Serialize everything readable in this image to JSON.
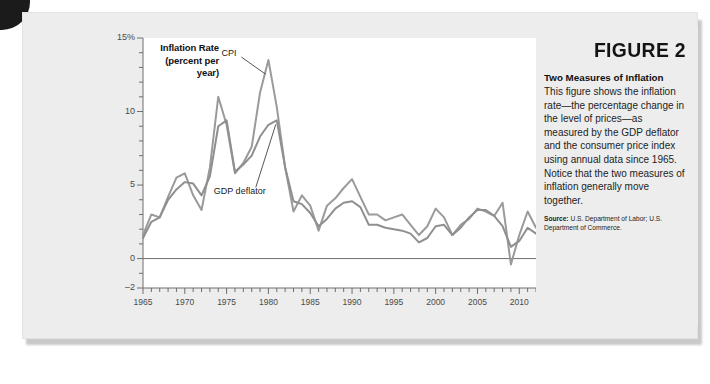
{
  "figure": {
    "number_label": "FIGURE 2",
    "caption_title": "Two Measures of Inflation",
    "caption_body": "This figure shows the inflation rate—the percentage change in the level of prices—as measured by the GDP deflator and the consumer price index using annual data since 1965. Notice that the two measures of inflation generally move together.",
    "source_label": "Source:",
    "source_text": "U.S. Department of Labor; U.S. Department of Commerce."
  },
  "colors": {
    "card_background": "#ededed",
    "plot_background": "#ffffff",
    "line_cpi": "#9a9a9a",
    "line_deflator": "#8f8f8f",
    "axis": "#6e6e6e",
    "text": "#1d1d1d"
  },
  "chart_data": {
    "type": "line",
    "title": "Inflation Rate",
    "subtitle": "(percent per year)",
    "xlabel": "",
    "ylabel": "Inflation Rate (percent per year)",
    "xlim": [
      1965,
      2012
    ],
    "ylim": [
      -2,
      15
    ],
    "yticks": [
      15,
      10,
      5,
      0,
      -2
    ],
    "ytick_labels": [
      "15%",
      "10",
      "5",
      "0",
      "–2"
    ],
    "y_minor_tick_step": 1,
    "xticks": [
      1965,
      1970,
      1975,
      1980,
      1985,
      1990,
      1995,
      2000,
      2005,
      2010
    ],
    "xtick_labels": [
      "1965",
      "1970",
      "1975",
      "1980",
      "1985",
      "1990",
      "1995",
      "2000",
      "2005",
      "2010"
    ],
    "x_minor_tick_step": 1,
    "grid": false,
    "legend_position": "inline-annotation",
    "annotations": [
      {
        "text": "CPI",
        "series": "CPI",
        "points_at_year": 1980
      },
      {
        "text": "GDP deflator",
        "series": "GDP deflator",
        "points_at_year": 1981
      }
    ],
    "x": [
      1965,
      1966,
      1967,
      1968,
      1969,
      1970,
      1971,
      1972,
      1973,
      1974,
      1975,
      1976,
      1977,
      1978,
      1979,
      1980,
      1981,
      1982,
      1983,
      1984,
      1985,
      1986,
      1987,
      1988,
      1989,
      1990,
      1991,
      1992,
      1993,
      1994,
      1995,
      1996,
      1997,
      1998,
      1999,
      2000,
      2001,
      2002,
      2003,
      2004,
      2005,
      2006,
      2007,
      2008,
      2009,
      2010,
      2011,
      2012
    ],
    "series": [
      {
        "name": "CPI",
        "values": [
          1.6,
          3.0,
          2.8,
          4.2,
          5.5,
          5.8,
          4.3,
          3.3,
          6.2,
          11.0,
          9.1,
          5.8,
          6.5,
          7.6,
          11.3,
          13.5,
          10.3,
          6.2,
          3.2,
          4.3,
          3.6,
          1.9,
          3.6,
          4.1,
          4.8,
          5.4,
          4.2,
          3.0,
          3.0,
          2.6,
          2.8,
          3.0,
          2.3,
          1.6,
          2.2,
          3.4,
          2.8,
          1.6,
          2.3,
          2.7,
          3.4,
          3.2,
          2.9,
          3.8,
          -0.4,
          1.6,
          3.2,
          2.1
        ]
      },
      {
        "name": "GDP deflator",
        "values": [
          1.4,
          2.5,
          2.8,
          4.0,
          4.7,
          5.2,
          5.1,
          4.3,
          5.6,
          9.0,
          9.4,
          5.9,
          6.4,
          7.0,
          8.3,
          9.1,
          9.4,
          6.2,
          3.9,
          3.7,
          3.1,
          2.2,
          2.7,
          3.4,
          3.8,
          3.9,
          3.5,
          2.3,
          2.3,
          2.1,
          2.0,
          1.9,
          1.7,
          1.1,
          1.4,
          2.2,
          2.3,
          1.6,
          2.1,
          2.8,
          3.3,
          3.3,
          2.9,
          2.2,
          0.8,
          1.2,
          2.1,
          1.7
        ]
      }
    ]
  }
}
